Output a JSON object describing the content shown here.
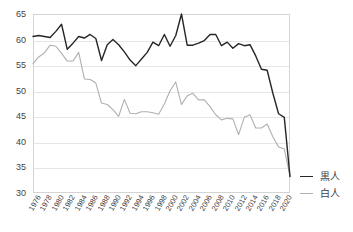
{
  "chart_data": {
    "type": "line",
    "title": "",
    "subtitle": "",
    "xlabel": "",
    "ylabel": "",
    "ylim": [
      30,
      65
    ],
    "xlim": [
      1976,
      2021
    ],
    "grid": true,
    "legend_position": "right",
    "ytick_labels": [
      "65",
      "60",
      "55",
      "50",
      "45",
      "40",
      "35",
      "30"
    ],
    "ytick_values": [
      65,
      60,
      55,
      50,
      45,
      40,
      35,
      30
    ],
    "xtick_labels": [
      "1976",
      "1978",
      "1980",
      "1982",
      "1984",
      "1986",
      "1988",
      "1990",
      "1992",
      "1994",
      "1996",
      "1998",
      "2000",
      "2002",
      "2004",
      "2006",
      "2008",
      "2010",
      "2012",
      "2014",
      "2016",
      "2018",
      "2020"
    ],
    "x": [
      1976,
      1977,
      1978,
      1979,
      1980,
      1981,
      1982,
      1983,
      1984,
      1985,
      1986,
      1987,
      1988,
      1989,
      1990,
      1991,
      1992,
      1993,
      1994,
      1995,
      1996,
      1997,
      1998,
      1999,
      2000,
      2001,
      2002,
      2003,
      2004,
      2005,
      2006,
      2007,
      2008,
      2009,
      2010,
      2011,
      2012,
      2013,
      2014,
      2015,
      2016,
      2017,
      2018,
      2019,
      2020,
      2021
    ],
    "series": [
      {
        "name": "黒人",
        "color": "#262626",
        "values": [
          60.6,
          60.8,
          60.6,
          60.4,
          61.6,
          63.0,
          58.1,
          59.3,
          60.6,
          60.3,
          61.0,
          60.2,
          55.9,
          59.0,
          60.0,
          59.0,
          57.6,
          56.0,
          54.9,
          56.2,
          57.5,
          59.5,
          58.8,
          61.0,
          58.7,
          60.8,
          65.0,
          58.9,
          58.9,
          59.3,
          59.8,
          61.0,
          61.0,
          58.8,
          59.5,
          58.3,
          59.2,
          58.8,
          59.0,
          56.8,
          54.2,
          54.0,
          49.5,
          45.5,
          44.8,
          33.2
        ]
      },
      {
        "name": "白人",
        "color": "#b0b0b0",
        "values": [
          55.3,
          56.6,
          57.4,
          58.9,
          58.7,
          57.3,
          55.8,
          55.8,
          57.5,
          52.3,
          52.2,
          51.5,
          47.6,
          47.3,
          46.3,
          45.0,
          48.3,
          45.6,
          45.5,
          45.9,
          45.9,
          45.7,
          45.4,
          47.4,
          50.0,
          51.7,
          47.3,
          49.0,
          49.5,
          48.2,
          48.2,
          46.9,
          45.3,
          44.3,
          44.6,
          44.5,
          41.4,
          44.8,
          45.3,
          42.7,
          42.7,
          43.5,
          41.0,
          39.0,
          38.6,
          33.3
        ]
      }
    ]
  },
  "legend": {
    "items": [
      {
        "label": "黒人",
        "color": "#262626"
      },
      {
        "label": "白人",
        "color": "#b0b0b0"
      }
    ]
  }
}
